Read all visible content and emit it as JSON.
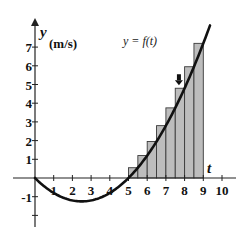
{
  "chart_data": {
    "type": "area",
    "title": "",
    "function_label": "y = f(t)",
    "function_formula": "f(t) = t(t - 5) / 5",
    "xlabel": "t",
    "ylabel": "y",
    "ylabel_units": "(m/s)",
    "xlim": [
      -1.2,
      10.8
    ],
    "ylim": [
      -2.6,
      8.4
    ],
    "x_ticks": [
      1,
      2,
      3,
      4,
      5,
      6,
      7,
      8,
      9,
      10
    ],
    "x_tick_labels": [
      "1",
      "2",
      "3",
      "4",
      "5",
      "6",
      "7",
      "8",
      "9",
      "10"
    ],
    "y_ticks": [
      -2,
      -1,
      1,
      2,
      3,
      4,
      5,
      6,
      7
    ],
    "y_tick_labels": [
      {
        "value": -1,
        "label": "-1"
      },
      {
        "value": 1,
        "label": "1"
      },
      {
        "value": 2,
        "label": "2"
      },
      {
        "value": 3,
        "label": "3"
      },
      {
        "value": 4,
        "label": "4"
      },
      {
        "value": 5,
        "label": "5"
      },
      {
        "value": 6,
        "label": "6"
      },
      {
        "value": 7,
        "label": "7"
      }
    ],
    "grid": false,
    "legend": null,
    "series": [
      {
        "name": "curve",
        "kind": "line",
        "t_range": [
          0,
          9.36
        ],
        "x": [
          0,
          1,
          2,
          2.5,
          3,
          4,
          5,
          6,
          7,
          8,
          9
        ],
        "values": [
          0,
          -0.8,
          -1.2,
          -1.25,
          -1.2,
          -0.8,
          0,
          1.2,
          2.8,
          4.8,
          7.2
        ]
      },
      {
        "name": "right-endpoint rectangles",
        "kind": "bar",
        "width": 0.5,
        "left_edges": [
          5,
          5.5,
          6,
          6.5,
          7,
          7.5,
          8,
          8.5
        ],
        "values": [
          0.55,
          1.2,
          1.95,
          2.8,
          3.75,
          4.8,
          5.95,
          7.2
        ]
      }
    ],
    "annotations": [
      {
        "type": "down-arrow",
        "points_to_bar_index": 5,
        "x": 7.75,
        "y": 4.8
      }
    ],
    "colors": {
      "curve": "#111111",
      "bar_fill": "#bdbdbd",
      "bar_stroke": "#3a3a3a",
      "axis": "#222222"
    }
  }
}
